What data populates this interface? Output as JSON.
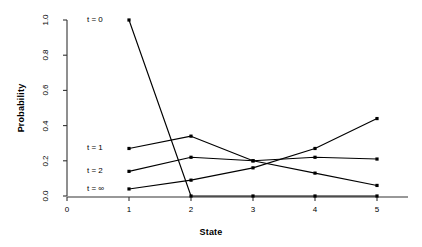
{
  "chart_data": {
    "type": "line",
    "title": "",
    "xlabel": "State",
    "ylabel": "Probability",
    "x": [
      1,
      2,
      3,
      4,
      5
    ],
    "xlim": [
      0,
      5.5
    ],
    "ylim": [
      0.0,
      1.0
    ],
    "xticks": [
      "0",
      "1",
      "2",
      "3",
      "4",
      "5"
    ],
    "xtick_values": [
      0,
      1,
      2,
      3,
      4,
      5
    ],
    "yticks": [
      "0.0",
      "0.2",
      "0.4",
      "0.6",
      "0.8",
      "1.0"
    ],
    "ytick_values": [
      0.0,
      0.2,
      0.4,
      0.6,
      0.8,
      1.0
    ],
    "grid": false,
    "legend_position": "inline-left",
    "line_color": "#000000",
    "marker_color": "#000000",
    "series": [
      {
        "name": "t = 0",
        "label": "t = 0",
        "values": [
          1.0,
          0.0,
          0.0,
          0.0,
          0.0
        ],
        "label_x": 1,
        "label_y": 1.0
      },
      {
        "name": "t = 1",
        "label": "t = 1",
        "values": [
          0.27,
          0.34,
          0.2,
          0.13,
          0.06
        ],
        "label_x": 1,
        "label_y": 0.27
      },
      {
        "name": "t = 2",
        "label": "t = 2",
        "values": [
          0.14,
          0.22,
          0.2,
          0.22,
          0.21
        ],
        "label_x": 1,
        "label_y": 0.14
      },
      {
        "name": "t = inf",
        "label": "t = ∞",
        "values": [
          0.04,
          0.09,
          0.16,
          0.27,
          0.44
        ],
        "label_x": 1,
        "label_y": 0.04
      }
    ]
  },
  "axes": {
    "y_title": "Probability",
    "x_title": "State"
  },
  "y_tick_labels": [
    "0.0",
    "0.2",
    "0.4",
    "0.6",
    "0.8",
    "1.0"
  ],
  "x_tick_labels": [
    "0",
    "1",
    "2",
    "3",
    "4",
    "5"
  ],
  "series_labels": [
    "t = 0",
    "t = 1",
    "t = 2",
    "t = ∞"
  ]
}
